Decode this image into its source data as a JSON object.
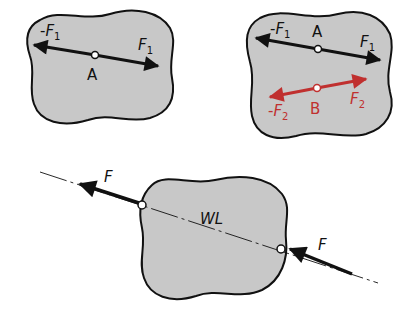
{
  "colors": {
    "body_fill": "#c8c8c8",
    "outline": "#111111",
    "force_black": "#111111",
    "force_red": "#c0302f",
    "background": "#ffffff"
  },
  "panel1": {
    "point": "A",
    "force_pos": {
      "sym": "F",
      "sub": "1"
    },
    "force_neg": {
      "prefix": "-",
      "sym": "F",
      "sub": "1"
    }
  },
  "panel2": {
    "point_a": "A",
    "point_b": "B",
    "force1_pos": {
      "sym": "F",
      "sub": "1"
    },
    "force1_neg": {
      "prefix": "-",
      "sym": "F",
      "sub": "1"
    },
    "force2_pos": {
      "sym": "F",
      "sub": "2"
    },
    "force2_neg": {
      "prefix": "-",
      "sym": "F",
      "sub": "2"
    }
  },
  "panel3": {
    "line_label": "WL",
    "force_left": "F",
    "force_right": "F"
  }
}
